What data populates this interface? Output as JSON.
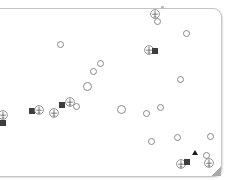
{
  "map": {
    "colors": {
      "border": "#c4c4c4",
      "marker_outline": "#8a8a8a",
      "square_fill": "#3d3d3d",
      "triangle_fill": "#1a1a1a",
      "background": "#ffffff"
    },
    "markers": [
      {
        "type": "airport",
        "icon": "airport-icon",
        "x": 155,
        "y": 14
      },
      {
        "type": "circle",
        "icon": "circle-marker-icon",
        "x": 157,
        "y": 21
      },
      {
        "type": "circle",
        "icon": "circle-marker-icon",
        "x": 186,
        "y": 33
      },
      {
        "type": "circle",
        "icon": "circle-marker-icon",
        "x": 60,
        "y": 44
      },
      {
        "type": "airport",
        "icon": "airport-icon",
        "x": 149,
        "y": 50
      },
      {
        "type": "square",
        "icon": "square-marker-icon",
        "x": 155,
        "y": 51
      },
      {
        "type": "circle",
        "icon": "circle-marker-icon",
        "x": 100,
        "y": 63
      },
      {
        "type": "circle",
        "icon": "circle-marker-icon",
        "x": 93,
        "y": 71
      },
      {
        "type": "circle",
        "icon": "circle-marker-icon",
        "x": 180,
        "y": 79
      },
      {
        "type": "circle-lg",
        "icon": "circle-marker-icon",
        "x": 87,
        "y": 86
      },
      {
        "type": "airport",
        "icon": "airport-icon",
        "x": 3,
        "y": 115
      },
      {
        "type": "square",
        "icon": "square-marker-icon",
        "x": 3,
        "y": 123
      },
      {
        "type": "square",
        "icon": "square-marker-icon",
        "x": 32,
        "y": 111
      },
      {
        "type": "airport",
        "icon": "airport-icon",
        "x": 39,
        "y": 110
      },
      {
        "type": "airport",
        "icon": "airport-icon",
        "x": 54,
        "y": 113
      },
      {
        "type": "square",
        "icon": "square-marker-icon",
        "x": 62,
        "y": 105
      },
      {
        "type": "airport",
        "icon": "airport-icon",
        "x": 70,
        "y": 102
      },
      {
        "type": "circle",
        "icon": "circle-marker-icon",
        "x": 76,
        "y": 106
      },
      {
        "type": "circle-lg",
        "icon": "circle-marker-icon",
        "x": 121,
        "y": 109
      },
      {
        "type": "circle",
        "icon": "circle-marker-icon",
        "x": 146,
        "y": 113
      },
      {
        "type": "circle",
        "icon": "circle-marker-icon",
        "x": 160,
        "y": 107
      },
      {
        "type": "circle",
        "icon": "circle-marker-icon",
        "x": 151,
        "y": 141
      },
      {
        "type": "circle",
        "icon": "circle-marker-icon",
        "x": 177,
        "y": 137
      },
      {
        "type": "circle",
        "icon": "circle-marker-icon",
        "x": 210,
        "y": 136
      },
      {
        "type": "triangle",
        "icon": "triangle-marker-icon",
        "x": 195,
        "y": 152
      },
      {
        "type": "circle",
        "icon": "circle-marker-icon",
        "x": 206,
        "y": 155
      },
      {
        "type": "airport",
        "icon": "airport-icon",
        "x": 209,
        "y": 163
      },
      {
        "type": "airport",
        "icon": "airport-icon",
        "x": 181,
        "y": 164
      },
      {
        "type": "square",
        "icon": "square-marker-icon",
        "x": 187,
        "y": 162
      }
    ]
  }
}
